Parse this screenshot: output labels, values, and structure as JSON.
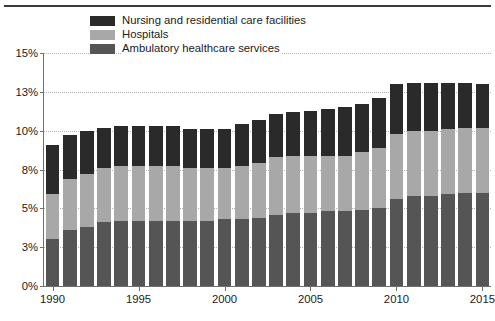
{
  "chart_data": {
    "type": "bar",
    "stacked": true,
    "title": "",
    "xlabel": "",
    "ylabel": "",
    "ylim": [
      0,
      15
    ],
    "grid": true,
    "legend_position": "top-left-inside",
    "ytick_labels": [
      "0%",
      "3%",
      "5%",
      "8%",
      "10%",
      "13%",
      "15%"
    ],
    "ytick_values": [
      0,
      2.5,
      5,
      7.5,
      10,
      12.5,
      15
    ],
    "xtick_labels": [
      "1990",
      "1995",
      "2000",
      "2005",
      "2010",
      "2015"
    ],
    "xtick_values": [
      1990,
      1995,
      2000,
      2005,
      2010,
      2015
    ],
    "categories": [
      "1990",
      "1991",
      "1992",
      "1993",
      "1994",
      "1995",
      "1996",
      "1997",
      "1998",
      "1999",
      "2000",
      "2001",
      "2002",
      "2003",
      "2004",
      "2005",
      "2006",
      "2007",
      "2008",
      "2009",
      "2010",
      "2011",
      "2012",
      "2013",
      "2014",
      "2015"
    ],
    "series": [
      {
        "name": "Ambulatory healthcare services",
        "color": "#555555",
        "values": [
          3.0,
          3.6,
          3.8,
          4.1,
          4.2,
          4.2,
          4.2,
          4.2,
          4.2,
          4.2,
          4.3,
          4.3,
          4.4,
          4.6,
          4.7,
          4.7,
          4.8,
          4.8,
          4.9,
          5.0,
          5.6,
          5.8,
          5.8,
          5.9,
          6.0,
          6.0
        ]
      },
      {
        "name": "Hospitals",
        "color": "#a8a8a8",
        "values": [
          2.9,
          3.3,
          3.4,
          3.5,
          3.5,
          3.5,
          3.5,
          3.5,
          3.4,
          3.4,
          3.3,
          3.4,
          3.5,
          3.7,
          3.7,
          3.7,
          3.6,
          3.6,
          3.7,
          3.9,
          4.2,
          4.2,
          4.2,
          4.2,
          4.2,
          4.2
        ]
      },
      {
        "name": "Nursing and residential care facilities",
        "color": "#2a2a2a",
        "values": [
          3.2,
          2.8,
          2.8,
          2.6,
          2.6,
          2.6,
          2.6,
          2.6,
          2.5,
          2.5,
          2.5,
          2.7,
          2.8,
          2.8,
          2.8,
          2.9,
          3.0,
          3.1,
          3.1,
          3.2,
          3.2,
          3.1,
          3.1,
          3.0,
          2.9,
          2.8
        ]
      }
    ],
    "totals": [
      9.1,
      9.7,
      10.0,
      10.2,
      10.3,
      10.3,
      10.3,
      10.3,
      10.1,
      10.1,
      10.1,
      10.4,
      10.7,
      11.1,
      11.2,
      11.3,
      11.4,
      11.5,
      11.7,
      12.1,
      13.0,
      13.1,
      13.1,
      13.1,
      13.1,
      13.0
    ]
  },
  "legend": {
    "items": [
      {
        "label": "Nursing and residential care facilities",
        "color": "#2a2a2a"
      },
      {
        "label": "Hospitals",
        "color": "#a8a8a8"
      },
      {
        "label": "Ambulatory healthcare services",
        "color": "#555555"
      }
    ]
  }
}
